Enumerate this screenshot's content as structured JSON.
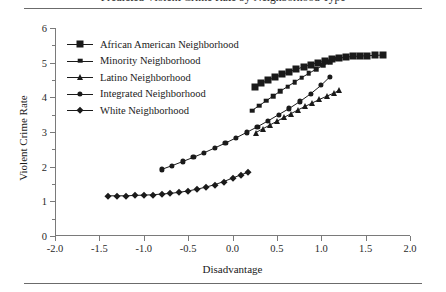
{
  "figure": {
    "title_partial": "Predicted Violent Crime Rate by Neighborhood Type",
    "has_top_rule": true,
    "has_bottom_rule": true
  },
  "chart_data": {
    "type": "line",
    "title": "",
    "xlabel": "Disadvantage",
    "ylabel": "Violent Crime Rate",
    "xlim": [
      -2.0,
      2.0
    ],
    "ylim": [
      0,
      6
    ],
    "xticks": [
      "-2.0",
      "-1.5",
      "-1.0",
      "-0.5",
      "0.0",
      "0.5",
      "1.0",
      "1.5",
      "2.0"
    ],
    "xtick_values": [
      -2.0,
      -1.5,
      -1.0,
      -0.5,
      0.0,
      0.5,
      1.0,
      1.5,
      2.0
    ],
    "yticks": [
      "0",
      "1",
      "2",
      "3",
      "4",
      "5",
      "6"
    ],
    "ytick_values": [
      0,
      1,
      2,
      3,
      4,
      5,
      6
    ],
    "yminor_values": [
      0.5,
      1.5,
      2.5,
      3.5,
      4.5,
      5.5
    ],
    "grid": false,
    "legend_position": "upper left",
    "line_color": "#1a1a1a",
    "series": [
      {
        "name": "African American Neighborhood",
        "marker": "square-large",
        "x": [
          0.25,
          0.32,
          0.4,
          0.48,
          0.56,
          0.64,
          0.72,
          0.8,
          0.88,
          0.96,
          1.04,
          1.12,
          1.2,
          1.28,
          1.36,
          1.44,
          1.52,
          1.6,
          1.7
        ],
        "y": [
          4.3,
          4.4,
          4.49,
          4.58,
          4.66,
          4.74,
          4.81,
          4.88,
          4.94,
          5.0,
          5.05,
          5.1,
          5.13,
          5.16,
          5.18,
          5.19,
          5.2,
          5.21,
          5.22
        ]
      },
      {
        "name": "Minority Neighborhood",
        "marker": "square-small",
        "x": [
          0.22,
          0.3,
          0.38,
          0.46,
          0.54,
          0.62,
          0.7,
          0.78,
          0.86,
          0.94,
          1.02,
          1.1,
          1.18
        ],
        "y": [
          3.62,
          3.76,
          3.9,
          4.04,
          4.18,
          4.31,
          4.44,
          4.57,
          4.69,
          4.81,
          4.92,
          5.02,
          5.11
        ]
      },
      {
        "name": "Latino Neighborhood",
        "marker": "triangle",
        "x": [
          0.26,
          0.34,
          0.42,
          0.5,
          0.58,
          0.66,
          0.74,
          0.82,
          0.9,
          0.98,
          1.06,
          1.14,
          1.2
        ],
        "y": [
          2.98,
          3.09,
          3.2,
          3.31,
          3.42,
          3.53,
          3.64,
          3.74,
          3.84,
          3.94,
          4.03,
          4.12,
          4.2
        ]
      },
      {
        "name": "Integrated Neighborhood",
        "marker": "circle",
        "x": [
          -0.8,
          -0.68,
          -0.56,
          -0.44,
          -0.32,
          -0.2,
          -0.08,
          0.04,
          0.16,
          0.28,
          0.4,
          0.52,
          0.64,
          0.76,
          0.88,
          1.0,
          1.1
        ],
        "y": [
          1.92,
          2.03,
          2.15,
          2.27,
          2.4,
          2.54,
          2.68,
          2.83,
          2.99,
          3.15,
          3.32,
          3.5,
          3.68,
          3.88,
          4.1,
          4.35,
          4.6
        ]
      },
      {
        "name": "White Neighborhood",
        "marker": "diamond",
        "x": [
          -1.4,
          -1.3,
          -1.2,
          -1.1,
          -1.0,
          -0.9,
          -0.8,
          -0.7,
          -0.6,
          -0.5,
          -0.4,
          -0.3,
          -0.2,
          -0.1,
          0.0,
          0.1,
          0.18
        ],
        "y": [
          1.16,
          1.16,
          1.16,
          1.17,
          1.18,
          1.19,
          1.21,
          1.23,
          1.26,
          1.3,
          1.35,
          1.41,
          1.48,
          1.57,
          1.67,
          1.77,
          1.84
        ]
      }
    ]
  }
}
